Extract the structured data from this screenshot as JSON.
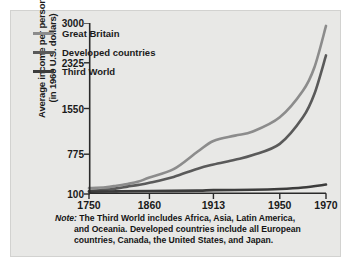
{
  "chart_data": {
    "type": "line",
    "title": "",
    "xlabel": "",
    "ylabel": "Average income per person (in 1960 U.S. dollars)",
    "ylabel_line1": "Average income per person",
    "ylabel_line2": "(in 1960 U.S. dollars)",
    "x": [
      1750,
      1860,
      1913,
      1950,
      1970
    ],
    "xticklabels": [
      "1750",
      "1860",
      "1913",
      "1950",
      "1970"
    ],
    "yticks": [
      100,
      775,
      1550,
      2325,
      3000
    ],
    "yticklabels": [
      "100",
      "775",
      "1550",
      "2325",
      "3000"
    ],
    "ylim": [
      100,
      3000
    ],
    "grid": false,
    "legend_position": "upper-left-inside",
    "series": [
      {
        "name": "Great Britain",
        "color": "#8c8c8c",
        "values": [
          200,
          380,
          1000,
          1400,
          2950
        ],
        "points": [
          [
            1750,
            200
          ],
          [
            1780,
            215
          ],
          [
            1800,
            240
          ],
          [
            1820,
            270
          ],
          [
            1840,
            310
          ],
          [
            1860,
            380
          ],
          [
            1880,
            520
          ],
          [
            1900,
            820
          ],
          [
            1913,
            1000
          ],
          [
            1925,
            1090
          ],
          [
            1935,
            1160
          ],
          [
            1950,
            1400
          ],
          [
            1960,
            1850
          ],
          [
            1965,
            2250
          ],
          [
            1970,
            2950
          ]
        ]
      },
      {
        "name": "Developed countries",
        "color": "#5a5a5a",
        "values": [
          150,
          290,
          600,
          950,
          2450
        ],
        "points": [
          [
            1750,
            150
          ],
          [
            1780,
            170
          ],
          [
            1800,
            195
          ],
          [
            1820,
            225
          ],
          [
            1840,
            255
          ],
          [
            1860,
            290
          ],
          [
            1880,
            390
          ],
          [
            1900,
            530
          ],
          [
            1913,
            600
          ],
          [
            1925,
            680
          ],
          [
            1935,
            760
          ],
          [
            1950,
            950
          ],
          [
            1960,
            1400
          ],
          [
            1965,
            1800
          ],
          [
            1970,
            2450
          ]
        ]
      },
      {
        "name": "Third World",
        "color": "#3c3c3c",
        "values": [
          140,
          150,
          165,
          185,
          260
        ],
        "points": [
          [
            1750,
            140
          ],
          [
            1800,
            145
          ],
          [
            1860,
            150
          ],
          [
            1900,
            158
          ],
          [
            1913,
            165
          ],
          [
            1935,
            172
          ],
          [
            1950,
            185
          ],
          [
            1960,
            210
          ],
          [
            1970,
            260
          ]
        ]
      }
    ]
  },
  "legend": {
    "items": [
      {
        "label": "Great Britain",
        "color": "#8c8c8c"
      },
      {
        "label": "Developed countries",
        "color": "#5a5a5a"
      },
      {
        "label": "Third World",
        "color": "#3c3c3c"
      }
    ]
  },
  "note": {
    "word": "Note:",
    "line1": "The Third World includes Africa, Asia, Latin America,",
    "line2": "and Oceania. Developed countries include all European",
    "line3": "countries, Canada, the United States, and Japan."
  },
  "colors": {
    "background": "#e8e8e6",
    "axis": "#2a2a2a",
    "text": "#1a1a1a"
  }
}
